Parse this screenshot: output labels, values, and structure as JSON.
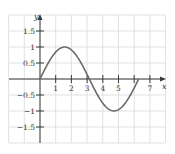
{
  "chart_data": {
    "type": "line",
    "title": "",
    "xlabel": "x",
    "ylabel": "y",
    "function": "y = sin(x)",
    "x_domain": [
      0,
      6.2832
    ],
    "xlim": [
      -2,
      8
    ],
    "ylim": [
      -2,
      2
    ],
    "grid": true,
    "legend": null,
    "x_ticks": [
      1,
      2,
      3,
      4,
      5,
      6,
      7
    ],
    "x_tick_labels": [
      "1",
      "2",
      "3",
      "4",
      "5",
      "",
      "7"
    ],
    "y_ticks": [
      1.5,
      1,
      0.5,
      -0.5,
      -1,
      -1.5
    ],
    "y_tick_labels": [
      "1.5",
      "1",
      "0.5",
      "−0.5",
      "−1",
      "−1.5"
    ],
    "series": [
      {
        "name": "sin(x)",
        "x": [
          0,
          0.5,
          1,
          1.5708,
          2,
          2.5,
          3,
          3.1416,
          3.5,
          4,
          4.5,
          4.7124,
          5,
          5.5,
          6,
          6.2832
        ],
        "y": [
          0,
          0.479,
          0.841,
          1,
          0.909,
          0.598,
          0.141,
          0,
          -0.351,
          -0.757,
          -0.978,
          -1,
          -0.959,
          -0.706,
          -0.279,
          0
        ]
      }
    ],
    "colors": {
      "grid": "#d9d9d9",
      "axes": "#3a3a3a",
      "curve": "#6a6a6a",
      "text": "#333333"
    }
  }
}
